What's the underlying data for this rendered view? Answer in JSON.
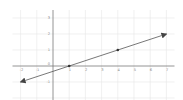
{
  "chart_data": {
    "type": "line",
    "title": "",
    "xlabel": "",
    "ylabel": "",
    "xlim": [
      -2.5,
      7.5
    ],
    "ylim": [
      -2.5,
      3.5
    ],
    "grid": true,
    "x_ticks": [
      -2,
      -1,
      1,
      2,
      3,
      4,
      5,
      6,
      7
    ],
    "x_tick_labels": [
      "-2",
      "-1",
      "1",
      "2",
      "3",
      "4",
      "5",
      "6",
      "7"
    ],
    "y_ticks": [
      -1,
      1,
      2,
      3
    ],
    "y_tick_labels": [
      "-1",
      "1",
      "2",
      "3"
    ],
    "origin_label": "0",
    "series": [
      {
        "name": "line",
        "equation": "y = (x - 1) / 3",
        "x": [
          -2,
          7
        ],
        "y": [
          -1,
          2
        ],
        "arrows": "both"
      }
    ],
    "marked_points": [
      {
        "x": 1,
        "y": 0
      },
      {
        "x": 4,
        "y": 1
      }
    ],
    "colors": {
      "line": "#555555",
      "grid": "#e6e6e6",
      "axis": "#7a7a7a"
    }
  }
}
